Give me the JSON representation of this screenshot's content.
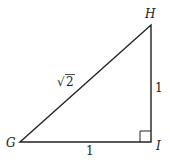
{
  "diagram": {
    "type": "right-triangle",
    "vertices": [
      {
        "name": "G",
        "label": "G"
      },
      {
        "name": "H",
        "label": "H"
      },
      {
        "name": "I",
        "label": "I"
      }
    ],
    "sides": {
      "GI": "1",
      "HI": "1",
      "GH_radical": "√",
      "GH_radicand": "2"
    },
    "right_angle_at": "I",
    "colors": {
      "stroke": "#222222",
      "background": "#ffffff"
    }
  }
}
